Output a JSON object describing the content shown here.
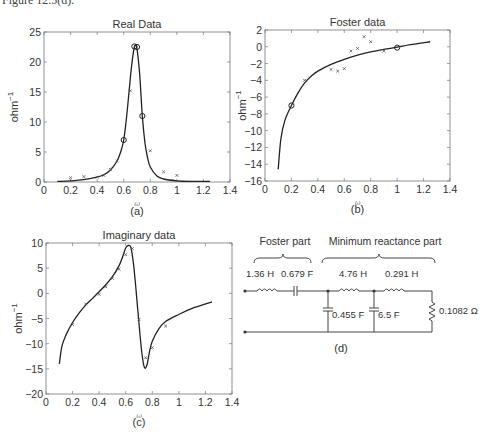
{
  "figure_header": "Figure 12.5(d).",
  "chart_data": [
    {
      "id": "a",
      "type": "line",
      "title": "Real Data",
      "xlabel": "ω",
      "ylabel": "ohm",
      "ylabel_exp": "−1",
      "caption": "(a)",
      "xlim": [
        0,
        1.4
      ],
      "ylim": [
        0,
        25
      ],
      "xticks": [
        0,
        0.2,
        0.4,
        0.6,
        0.8,
        1,
        1.2,
        1.4
      ],
      "xtick_labels": [
        "0",
        "0.2",
        "0.4",
        "0.6",
        "0.8",
        "1",
        "1.2",
        "1.4"
      ],
      "yticks": [
        0,
        5,
        10,
        15,
        20,
        25
      ],
      "ytick_labels": [
        "0",
        "5",
        "10",
        "15",
        "20",
        "25"
      ],
      "grid": false,
      "fit_curve": {
        "name": "fit",
        "x": [
          0.1,
          0.2,
          0.3,
          0.4,
          0.45,
          0.5,
          0.55,
          0.58,
          0.6,
          0.62,
          0.64,
          0.66,
          0.68,
          0.69,
          0.7,
          0.72,
          0.74,
          0.76,
          0.78,
          0.8,
          0.85,
          0.9,
          1.0,
          1.1,
          1.25
        ],
        "y": [
          0.1,
          0.2,
          0.4,
          0.8,
          1.2,
          2.0,
          3.5,
          5.2,
          7.0,
          10.5,
          15.0,
          19.5,
          22.5,
          22.7,
          22.2,
          18.0,
          11.0,
          6.5,
          4.0,
          2.5,
          1.0,
          0.5,
          0.2,
          0.1,
          0.1
        ]
      },
      "measured_points": {
        "name": "measured",
        "marker": "x",
        "x": [
          0.2,
          0.3,
          0.4,
          0.45,
          0.5,
          0.55,
          0.65,
          0.8,
          0.9,
          1.0
        ],
        "y": [
          0.7,
          0.9,
          0.8,
          1.1,
          2.1,
          3.5,
          15.2,
          5.2,
          1.7,
          1.1
        ]
      },
      "highlight_points": {
        "name": "selected",
        "marker": "o",
        "x": [
          0.6,
          0.68,
          0.7,
          0.74
        ],
        "y": [
          7.0,
          22.6,
          22.5,
          11.0
        ]
      }
    },
    {
      "id": "b",
      "type": "line",
      "title": "Foster data",
      "xlabel": "ω",
      "ylabel": "ohm",
      "ylabel_exp": "−1",
      "caption": "(b)",
      "xlim": [
        0,
        1.4
      ],
      "ylim": [
        -16,
        2
      ],
      "xticks": [
        0,
        0.2,
        0.4,
        0.6,
        0.8,
        1,
        1.2,
        1.4
      ],
      "xtick_labels": [
        "0",
        "0.2",
        "0.4",
        "0.6",
        "0.8",
        "1",
        "1.2",
        "1.4"
      ],
      "yticks": [
        -16,
        -14,
        -12,
        -10,
        -8,
        -6,
        -4,
        -2,
        0,
        2
      ],
      "ytick_labels": [
        "−16",
        "−14",
        "−12",
        "−10",
        "−8",
        "−6",
        "−4",
        "−2",
        "0",
        "2"
      ],
      "grid": false,
      "fit_curve": {
        "name": "fit",
        "x": [
          0.1,
          0.12,
          0.15,
          0.2,
          0.25,
          0.3,
          0.35,
          0.4,
          0.5,
          0.6,
          0.7,
          0.8,
          0.9,
          1.0,
          1.1,
          1.25
        ],
        "y": [
          -14.6,
          -11.0,
          -8.8,
          -7.0,
          -5.5,
          -4.3,
          -3.5,
          -2.9,
          -2.1,
          -1.5,
          -1.0,
          -0.6,
          -0.3,
          -0.05,
          0.25,
          0.6
        ]
      },
      "measured_points": {
        "name": "measured",
        "marker": "x",
        "x": [
          0.3,
          0.5,
          0.55,
          0.6,
          0.65,
          0.7,
          0.75,
          0.8,
          0.9
        ],
        "y": [
          -4.0,
          -2.7,
          -2.9,
          -2.6,
          -0.5,
          -0.2,
          1.2,
          0.6,
          -0.5
        ]
      },
      "highlight_points": {
        "name": "selected",
        "marker": "o",
        "x": [
          0.2,
          1.0
        ],
        "y": [
          -7.0,
          -0.1
        ]
      }
    },
    {
      "id": "c",
      "type": "line",
      "title": "Imaginary data",
      "xlabel": "ω",
      "ylabel": "ohm",
      "ylabel_exp": "−1",
      "caption": "(c)",
      "xlim": [
        0,
        1.4
      ],
      "ylim": [
        -20,
        10
      ],
      "xticks": [
        0,
        0.2,
        0.4,
        0.6,
        0.8,
        1,
        1.2,
        1.4
      ],
      "xtick_labels": [
        "0",
        "0.2",
        "0.4",
        "0.6",
        "0.8",
        "1",
        "1.2",
        "1.4"
      ],
      "yticks": [
        -20,
        -15,
        -10,
        -5,
        0,
        5,
        10
      ],
      "ytick_labels": [
        "−20",
        "−15",
        "−10",
        "−5",
        "0",
        "5",
        "10"
      ],
      "grid": false,
      "fit_curve": {
        "name": "fit",
        "x": [
          0.1,
          0.12,
          0.15,
          0.2,
          0.25,
          0.3,
          0.35,
          0.4,
          0.45,
          0.5,
          0.55,
          0.58,
          0.6,
          0.62,
          0.64,
          0.66,
          0.68,
          0.7,
          0.72,
          0.74,
          0.76,
          0.78,
          0.8,
          0.85,
          0.9,
          1.0,
          1.1,
          1.25
        ],
        "y": [
          -14.0,
          -10.5,
          -8.3,
          -5.8,
          -3.9,
          -2.3,
          -1.0,
          0.3,
          1.7,
          3.3,
          5.5,
          7.5,
          9.0,
          9.5,
          9.0,
          5.5,
          0.0,
          -6.0,
          -11.5,
          -14.7,
          -14.2,
          -11.5,
          -9.5,
          -7.0,
          -5.6,
          -4.2,
          -3.0,
          -1.7
        ]
      },
      "measured_points": {
        "name": "measured",
        "marker": "x",
        "x": [
          0.2,
          0.3,
          0.4,
          0.45,
          0.5,
          0.55,
          0.6,
          0.65,
          0.7,
          0.75,
          0.8,
          0.9
        ],
        "y": [
          -6.2,
          -2.1,
          -0.2,
          1.3,
          3.0,
          4.8,
          7.7,
          8.9,
          -5.2,
          -12.8,
          -10.8,
          -6.5
        ]
      }
    }
  ],
  "circuit": {
    "caption": "(d)",
    "foster_heading": "Foster part",
    "min_reactance_heading": "Minimum reactance part",
    "components": [
      {
        "type": "inductor",
        "label": "1.36 H",
        "branch": "series"
      },
      {
        "type": "capacitor",
        "label": "0.679 F",
        "branch": "series"
      },
      {
        "type": "capacitor",
        "label": "0.455 F",
        "branch": "shunt"
      },
      {
        "type": "inductor",
        "label": "4.76 H",
        "branch": "series"
      },
      {
        "type": "capacitor",
        "label": "6.5 F",
        "branch": "shunt"
      },
      {
        "type": "inductor",
        "label": "0.291 H",
        "branch": "series"
      },
      {
        "type": "resistor",
        "label": "0.1082 Ω",
        "branch": "load"
      }
    ]
  }
}
